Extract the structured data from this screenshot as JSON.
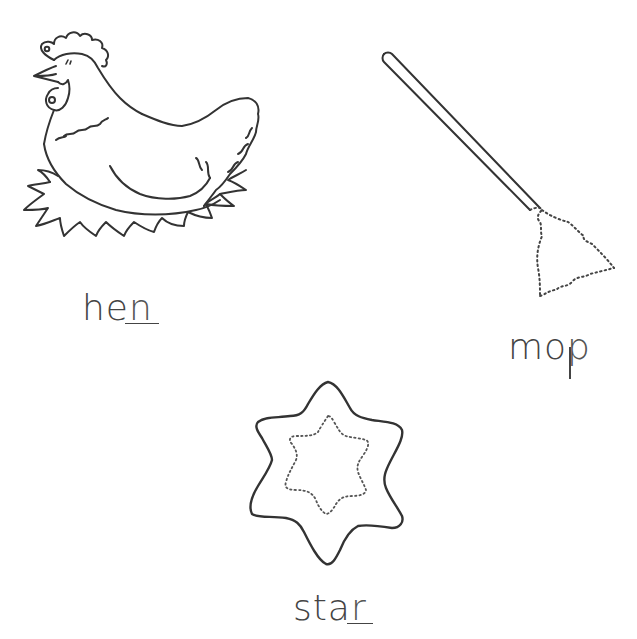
{
  "worksheet": {
    "items": [
      {
        "picture": "hen",
        "icon": "hen-on-nest-icon",
        "word_stem": "he",
        "traced_letter": "n",
        "full_word": "hen"
      },
      {
        "picture": "mop",
        "icon": "mop-icon",
        "word_stem": "mo",
        "traced_letter": "p",
        "full_word": "mop"
      },
      {
        "picture": "star",
        "icon": "star-icon",
        "word_stem": "sta",
        "traced_letter": "r",
        "full_word": "star"
      }
    ]
  },
  "colors": {
    "background": "#ffffff",
    "line": "#3a3a3a"
  }
}
